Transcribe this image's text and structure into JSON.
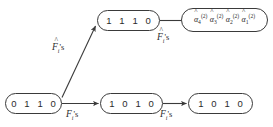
{
  "diagram": {
    "background_color": "#ffffff",
    "stroke_color": "#3a3a3a",
    "text_color": "#2b2b2b",
    "width": 273,
    "height": 127
  },
  "nodes": {
    "start": {
      "id": "node-0110",
      "label": "0 1 1 0",
      "kind": "bit-pattern"
    },
    "top_middle": {
      "id": "node-1110",
      "label": "1 1 1 0",
      "kind": "bit-pattern"
    },
    "bottom_middle": {
      "id": "node-1010-middle",
      "label": "1 0 1 0",
      "kind": "bit-pattern"
    },
    "bottom_right": {
      "id": "node-1010-right",
      "label": "1 0 1 0",
      "kind": "bit-pattern"
    },
    "alpha": {
      "id": "node-alpha-estimates",
      "kind": "alpha-list",
      "terms": [
        {
          "base": "α",
          "hat": "^",
          "sub": "4",
          "sup": "(2)"
        },
        {
          "base": "α",
          "hat": "^",
          "sub": "3",
          "sup": "(2)"
        },
        {
          "base": "α",
          "hat": "^",
          "sub": "2",
          "sup": "(2)"
        },
        {
          "base": "α",
          "hat": "^",
          "sub": "1",
          "sup": "(2)"
        }
      ]
    }
  },
  "edges": [
    {
      "id": "edge-diagonal",
      "from": "node-0110",
      "to": "node-1110",
      "arrowhead": true,
      "label": {
        "base": "F",
        "hat": "^",
        "sub": "i",
        "tail": "'s"
      }
    },
    {
      "id": "edge-top-right",
      "from": "node-1110",
      "to": "node-alpha-estimates",
      "arrowhead": false,
      "label": {
        "base": "F",
        "hat": "^",
        "sub": "i",
        "tail": "'s"
      }
    },
    {
      "id": "edge-bottom-left",
      "from": "node-0110",
      "to": "node-1010-middle",
      "arrowhead": true,
      "label": {
        "base": "F",
        "hat": "",
        "sub": "i",
        "tail": "'s"
      }
    },
    {
      "id": "edge-bottom-right",
      "from": "node-1010-middle",
      "to": "node-1010-right",
      "arrowhead": true,
      "label": {
        "base": "F",
        "hat": "",
        "sub": "i",
        "tail": "'s"
      }
    }
  ]
}
